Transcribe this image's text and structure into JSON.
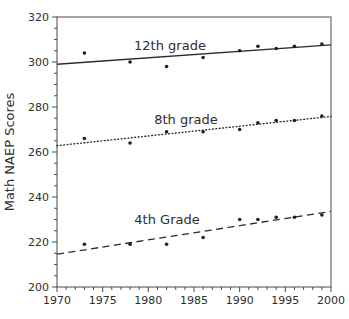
{
  "figure": {
    "background": "#ffffff"
  },
  "chart_data": {
    "type": "scatter",
    "title": "",
    "xlabel": "",
    "ylabel": "Math NAEP Scores",
    "grid": false,
    "legend": "inline-labels",
    "x_axis": {
      "min": 1970,
      "max": 2000,
      "major_step": 5,
      "minor_step": 1,
      "tick_labels": [
        "1970",
        "1975",
        "1980",
        "1985",
        "1990",
        "1995",
        "2000"
      ]
    },
    "y_axis": {
      "min": 200,
      "max": 320,
      "major_step": 20,
      "minor_step": 5,
      "tick_labels": [
        "200",
        "220",
        "240",
        "260",
        "280",
        "300",
        "320"
      ]
    },
    "x": [
      1973,
      1978,
      1982,
      1986,
      1990,
      1992,
      1994,
      1996,
      1999
    ],
    "series": [
      {
        "name": "12th grade",
        "values": [
          304,
          300,
          298,
          302,
          305,
          307,
          306,
          307,
          308
        ],
        "line_style": "solid",
        "trend": {
          "start_year": 1970,
          "start_value": 299.0,
          "end_year": 2000,
          "end_value": 307.6
        },
        "label_pos": {
          "x": 170,
          "y": 50
        }
      },
      {
        "name": "8th grade",
        "values": [
          266,
          264,
          269,
          269,
          270,
          273,
          274,
          274,
          276
        ],
        "line_style": "dotted",
        "trend": {
          "start_year": 1970,
          "start_value": 262.8,
          "end_year": 2000,
          "end_value": 275.8
        },
        "label_pos": {
          "x": 186,
          "y": 124
        }
      },
      {
        "name": "4th Grade",
        "values": [
          219,
          219,
          219,
          222,
          230,
          230,
          231,
          231,
          232
        ],
        "line_style": "dashed",
        "trend": {
          "start_year": 1970,
          "start_value": 214.6,
          "end_year": 2000,
          "end_value": 233.6
        },
        "label_pos": {
          "x": 167,
          "y": 224
        }
      }
    ],
    "colors": {
      "line": "#2b2b2b",
      "marker": "#1e1e1e",
      "text": "#2e2e2e",
      "frame": "#4a4a4a"
    }
  }
}
